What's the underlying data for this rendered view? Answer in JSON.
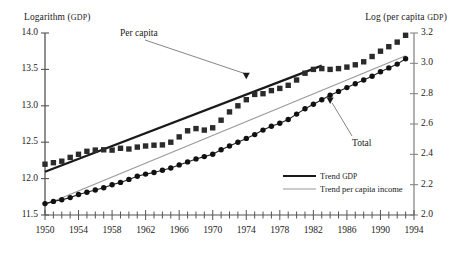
{
  "chart_data": {
    "type": "line",
    "title": "",
    "subtitle": "",
    "xlabel": "",
    "ylabel": "Logarithm (GDP)",
    "ylabel_right": "Log (per capita GDP)",
    "axis_titles": {
      "left_main": "Logarithm (",
      "left_sc": "GDP",
      "left_end": ")",
      "right_main": "Log (per capita ",
      "right_sc": "GDP",
      "right_end": ")"
    },
    "xlim": [
      1950,
      1994
    ],
    "ylim": [
      11.5,
      14.0
    ],
    "ylim_right": [
      2.0,
      3.2
    ],
    "grid": false,
    "legend_position": "inside-lower-right",
    "x_tick_labels": [
      "1950",
      "1954",
      "1958",
      "1962",
      "1966",
      "1970",
      "1974",
      "1978",
      "1982",
      "1986",
      "1990",
      "1994"
    ],
    "x_tick_values": [
      1950,
      1954,
      1958,
      1962,
      1966,
      1970,
      1974,
      1978,
      1982,
      1986,
      1990,
      1994
    ],
    "x_minor_step": 1,
    "y_tick_labels_left": [
      "11.5",
      "12.0",
      "12.5",
      "13.0",
      "13.5",
      "14.0"
    ],
    "y_tick_values_left": [
      11.5,
      12.0,
      12.5,
      13.0,
      13.5,
      14.0
    ],
    "y_tick_labels_right": [
      "2.0",
      "2.2",
      "2.4",
      "2.6",
      "2.8",
      "3.0",
      "3.2"
    ],
    "y_tick_values_right": [
      2.0,
      2.2,
      2.4,
      2.6,
      2.8,
      3.0,
      3.2
    ],
    "x": [
      1950,
      1951,
      1952,
      1953,
      1954,
      1955,
      1956,
      1957,
      1958,
      1959,
      1960,
      1961,
      1962,
      1963,
      1964,
      1965,
      1966,
      1967,
      1968,
      1969,
      1970,
      1971,
      1972,
      1973,
      1974,
      1975,
      1976,
      1977,
      1978,
      1979,
      1980,
      1981,
      1982,
      1983,
      1984,
      1985,
      1986,
      1987,
      1988,
      1989,
      1990,
      1991,
      1992,
      1993
    ],
    "series": [
      {
        "name": "Per capita",
        "axis": "right",
        "marker": "square",
        "color": "#2b2b2b",
        "values": [
          2.335,
          2.345,
          2.355,
          2.38,
          2.4,
          2.42,
          2.428,
          2.43,
          2.428,
          2.44,
          2.435,
          2.448,
          2.455,
          2.46,
          2.462,
          2.48,
          2.515,
          2.555,
          2.57,
          2.56,
          2.575,
          2.625,
          2.68,
          2.72,
          2.76,
          2.795,
          2.8,
          2.82,
          2.835,
          2.855,
          2.89,
          2.935,
          2.96,
          2.965,
          2.96,
          2.965,
          2.975,
          2.99,
          3.01,
          3.045,
          3.08,
          3.11,
          3.14,
          3.185
        ]
      },
      {
        "name": "Total",
        "axis": "right",
        "marker": "circle",
        "color": "#111111",
        "values": [
          2.075,
          2.09,
          2.1,
          2.115,
          2.135,
          2.15,
          2.165,
          2.18,
          2.2,
          2.215,
          2.235,
          2.255,
          2.27,
          2.28,
          2.295,
          2.31,
          2.33,
          2.35,
          2.37,
          2.385,
          2.4,
          2.43,
          2.455,
          2.48,
          2.505,
          2.53,
          2.56,
          2.585,
          2.605,
          2.63,
          2.665,
          2.7,
          2.73,
          2.76,
          2.79,
          2.815,
          2.84,
          2.865,
          2.89,
          2.915,
          2.945,
          2.97,
          2.995,
          3.03
        ]
      }
    ],
    "trend_lines": [
      {
        "name": "Trend GDP",
        "color": "#1a1a1a",
        "width": 2.2,
        "x0": 1950,
        "y0": 2.285,
        "x1": 1983,
        "y1": 2.985
      },
      {
        "name": "Trend per capita income",
        "color": "#9a9a9a",
        "width": 1.2,
        "x0": 1950,
        "y0": 2.068,
        "x1": 1993,
        "y1": 3.05
      }
    ],
    "annotations": [
      {
        "name": "Per capita",
        "label": "Per capita",
        "target_x": 1974,
        "target_y": 2.885
      },
      {
        "name": "Total",
        "label": "Total",
        "target_x": 1984,
        "target_y": 2.785
      }
    ],
    "legend": [
      {
        "label_main": "Trend ",
        "label_sc": "GDP",
        "label_end": "",
        "style": "thick-black"
      },
      {
        "label_main": "Trend per capita income",
        "label_sc": "",
        "label_end": "",
        "style": "thin-gray"
      }
    ]
  }
}
